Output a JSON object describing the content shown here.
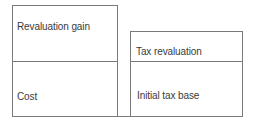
{
  "diagram": {
    "left_block": {
      "top_segment": "Revaluation gain",
      "bottom_segment": "Cost"
    },
    "right_block": {
      "top_segment": "Tax revaluation",
      "bottom_segment": "Initial tax base"
    },
    "line_color": "#7a7a7a",
    "text_color": "#3a3a3a"
  }
}
